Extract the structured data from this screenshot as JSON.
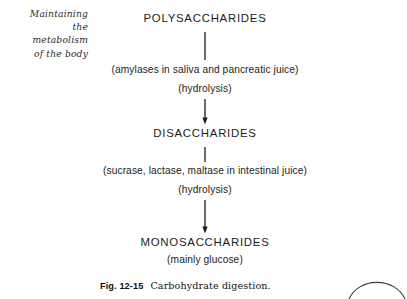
{
  "margin_note": {
    "lines": [
      "Maintaining",
      "the",
      "metabolism",
      "of the body"
    ]
  },
  "flowchart": {
    "type": "flow-diagram",
    "orientation": "vertical",
    "nodes": [
      {
        "label": "POLYSACCHARIDES",
        "style": "uppercase-heading"
      },
      {
        "label": "DISACCHARIDES",
        "style": "uppercase-heading"
      },
      {
        "label": "MONOSACCHARIDES",
        "style": "uppercase-heading"
      }
    ],
    "steps": [
      {
        "from": "POLYSACCHARIDES",
        "to": "DISACCHARIDES",
        "agents": "(amylases in saliva and pancreatic juice)",
        "reaction": "(hydrolysis)"
      },
      {
        "from": "DISACCHARIDES",
        "to": "MONOSACCHARIDES",
        "agents": "(sucrase, lactase, maltase in intestinal juice)",
        "reaction": "(hydrolysis)"
      }
    ],
    "final_note": "(mainly glucose)",
    "arrow_color": "#1c1c1c"
  },
  "caption": {
    "figure_label": "Fig. 12-15",
    "figure_text": "Carbohydrate digestion."
  },
  "decoration": {
    "corner_arc": "page-corner-arc"
  }
}
